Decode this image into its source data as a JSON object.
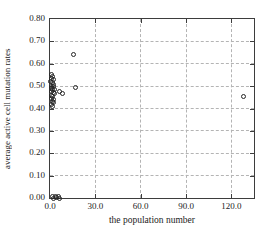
{
  "chart_data": {
    "type": "scatter",
    "title": "",
    "xlabel": "the population number",
    "ylabel": "average active cell mutation rates",
    "xlim": [
      0,
      135
    ],
    "ylim": [
      0,
      0.8
    ],
    "x_ticks": [
      0,
      30,
      60,
      90,
      120
    ],
    "x_tick_labels": [
      "0.0",
      "30.0",
      "60.0",
      "90.0",
      "120.0"
    ],
    "y_ticks": [
      0,
      0.1,
      0.2,
      0.3,
      0.4,
      0.5,
      0.6,
      0.7,
      0.8
    ],
    "y_tick_labels": [
      "0.00",
      "0.10",
      "0.20",
      "0.30",
      "0.40",
      "0.50",
      "0.60",
      "0.70",
      "0.80"
    ],
    "grid": true,
    "legend": false,
    "marker": "open-circle",
    "points": [
      [
        0.8,
        0.55
      ],
      [
        1.8,
        0.545
      ],
      [
        1.2,
        0.535
      ],
      [
        2.3,
        0.53
      ],
      [
        0.6,
        0.52
      ],
      [
        1.6,
        0.515
      ],
      [
        2.6,
        0.508
      ],
      [
        1.0,
        0.5
      ],
      [
        2.0,
        0.498
      ],
      [
        0.7,
        0.49
      ],
      [
        1.7,
        0.487
      ],
      [
        2.8,
        0.483
      ],
      [
        1.2,
        0.476
      ],
      [
        2.2,
        0.47
      ],
      [
        3.3,
        0.466
      ],
      [
        0.8,
        0.46
      ],
      [
        1.9,
        0.454
      ],
      [
        1.0,
        0.446
      ],
      [
        2.1,
        0.44
      ],
      [
        1.4,
        0.432
      ],
      [
        2.5,
        0.425
      ],
      [
        0.9,
        0.416
      ],
      [
        1.9,
        0.41
      ],
      [
        6.0,
        0.476
      ],
      [
        8.5,
        0.468
      ],
      [
        15.5,
        0.64
      ],
      [
        17.0,
        0.495
      ],
      [
        128.0,
        0.455
      ],
      [
        1.5,
        0.006
      ],
      [
        2.6,
        0.0
      ],
      [
        3.6,
        0.007
      ],
      [
        4.6,
        0.002
      ],
      [
        5.6,
        0.006
      ],
      [
        6.6,
        0.0
      ]
    ]
  },
  "colors": {
    "background": "#ffffff",
    "frame": "#3d3d3d",
    "grid": "#b4b4b4",
    "marker": "#262626",
    "text": "#1c1c1c"
  }
}
